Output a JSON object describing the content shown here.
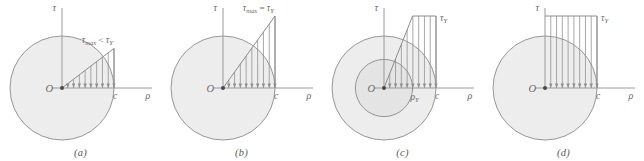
{
  "figure": {
    "background": "#ffffff",
    "stroke_color": "#8c8c8c",
    "fill_color": "#ededed",
    "text_color": "#6b6b6b",
    "axis_color": "#9a9a9a"
  },
  "symbols": {
    "tau": "τ",
    "rho": "ρ",
    "origin": "O",
    "radius_outer": "c",
    "sub_max": "max",
    "sub_yield": "Y",
    "less_than": "<",
    "equals": "="
  },
  "panels": [
    {
      "id": "a",
      "caption": "(a)",
      "state": "elastic",
      "axis_tau_label": "τ",
      "axis_rho_label": "ρ",
      "origin_label": "O",
      "outer_radius_label": "c",
      "inner_radius_label": null,
      "stress_label_base": "τ",
      "stress_label_sub": "max",
      "stress_label_op": "<",
      "stress_label_tail_base": "τ",
      "stress_label_tail_sub": "Y",
      "peak_fraction": 0.55,
      "elastic_core_fraction": 1.0,
      "n_arrows": 9
    },
    {
      "id": "b",
      "caption": "(b)",
      "state": "yield-onset",
      "axis_tau_label": "τ",
      "axis_rho_label": "ρ",
      "origin_label": "O",
      "outer_radius_label": "c",
      "inner_radius_label": null,
      "stress_label_base": "τ",
      "stress_label_sub": "max",
      "stress_label_op": "=",
      "stress_label_tail_base": "τ",
      "stress_label_tail_sub": "Y",
      "peak_fraction": 1.0,
      "elastic_core_fraction": 1.0,
      "n_arrows": 9
    },
    {
      "id": "c",
      "caption": "(c)",
      "state": "partially-plastic",
      "axis_tau_label": "τ",
      "axis_rho_label": "ρ",
      "origin_label": "O",
      "outer_radius_label": "c",
      "inner_radius_label_base": "ρ",
      "inner_radius_label_sub": "Y",
      "stress_label_base": "τ",
      "stress_label_sub": "Y",
      "stress_label_op": null,
      "peak_fraction": 1.0,
      "elastic_core_fraction": 0.55,
      "n_arrows": 9
    },
    {
      "id": "d",
      "caption": "(d)",
      "state": "fully-plastic",
      "axis_tau_label": "τ",
      "axis_rho_label": "ρ",
      "origin_label": "O",
      "outer_radius_label": "c",
      "inner_radius_label": null,
      "stress_label_base": "τ",
      "stress_label_sub": "Y",
      "stress_label_op": null,
      "peak_fraction": 1.0,
      "elastic_core_fraction": 0.0,
      "n_arrows": 9
    }
  ],
  "chart_data": {
    "type": "line",
    "xlabel": "ρ",
    "ylabel": "τ",
    "series": [
      {
        "name": "(a) elastic: τmax < τY",
        "x": [
          0,
          1
        ],
        "values": [
          0,
          0.55
        ],
        "note": "linear ramp from center to surface, peak below yield"
      },
      {
        "name": "(b) onset of yield: τmax = τY",
        "x": [
          0,
          1
        ],
        "values": [
          0,
          1.0
        ],
        "note": "linear ramp reaching yield exactly at the surface"
      },
      {
        "name": "(c) partially plastic",
        "x": [
          0,
          0.55,
          1
        ],
        "values": [
          0,
          1.0,
          1.0
        ],
        "note": "linear within elastic core up to ρY, constant τY beyond"
      },
      {
        "name": "(d) fully plastic",
        "x": [
          0,
          1
        ],
        "values": [
          1.0,
          1.0
        ],
        "note": "uniform τY across the entire radius"
      }
    ],
    "xlim": [
      0,
      1
    ],
    "ylim": [
      0,
      1
    ],
    "grid": false,
    "legend": "none"
  }
}
